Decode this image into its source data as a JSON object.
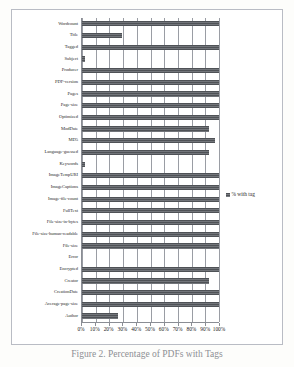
{
  "figure": {
    "caption": "Figure 2. Percentage of PDFs with Tags"
  },
  "legend": {
    "position": "right",
    "swatch_name": "legend-swatch",
    "entries": [
      {
        "label": "% with tag",
        "color": "#55585c"
      }
    ]
  },
  "axis": {
    "x_ticklabels": [
      "0%",
      "10%",
      "20%",
      "30%",
      "40%",
      "50%",
      "60%",
      "70%",
      "80%",
      "90%",
      "100%"
    ]
  },
  "chart_data": {
    "type": "bar",
    "orientation": "horizontal",
    "title": "",
    "subtitle": "",
    "xlabel": "",
    "ylabel": "",
    "xlim": [
      0,
      100
    ],
    "xticks": [
      0,
      10,
      20,
      30,
      40,
      50,
      60,
      70,
      80,
      90,
      100
    ],
    "xtick_labels": [
      "0%",
      "10%",
      "20%",
      "30%",
      "40%",
      "50%",
      "60%",
      "70%",
      "80%",
      "90%",
      "100%"
    ],
    "grid": true,
    "grid_axis": "x",
    "legend_position": "right",
    "bar_color": "#55585c",
    "categories": [
      "Wordcount",
      "Title",
      "Tagged",
      "Subject",
      "Producer",
      "PDF-version",
      "Pages",
      "Page-size",
      "Optimized",
      "ModDate",
      "MD5",
      "Language-guessed",
      "Keywords",
      "ImageTempURI",
      "ImageCaptions",
      "Image-file-count",
      "FullText",
      "File-size-in-bytes",
      "File-size-human-readable",
      "File-size",
      "Error",
      "Encrypted",
      "Creator",
      "CreationDate",
      "Average-page-size",
      "Author"
    ],
    "series": [
      {
        "name": "% with tag",
        "values": [
          100,
          29,
          100,
          2,
          100,
          100,
          100,
          100,
          100,
          93,
          97,
          93,
          2,
          100,
          100,
          100,
          100,
          100,
          100,
          100,
          0,
          100,
          93,
          100,
          100,
          26
        ]
      }
    ]
  }
}
